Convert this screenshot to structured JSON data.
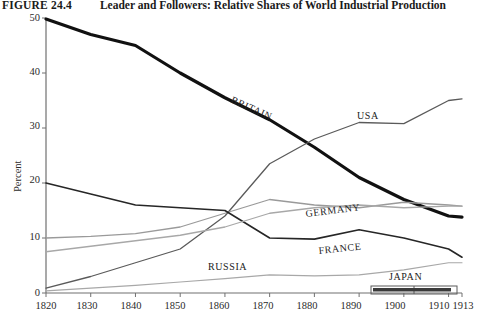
{
  "caption": {
    "figure_number": "FIGURE 24.4",
    "title": "Leader and Followers: Relative Shares of World Industrial Production"
  },
  "axis": {
    "ylabel": "Percent",
    "yticks": [
      "0",
      "10",
      "20",
      "30",
      "40",
      "50"
    ],
    "xticks": [
      "1820",
      "1830",
      "1840",
      "1850",
      "1860",
      "1870",
      "1880",
      "1890",
      "1900",
      "1910",
      "1913"
    ]
  },
  "series_labels": {
    "britain": "BRITAIN",
    "usa": "USA",
    "germany": "GERMANY",
    "france": "FRANCE",
    "russia": "RUSSIA",
    "japan": "JAPAN"
  },
  "colors": {
    "britain": "#111111",
    "usa": "#5a5a5a",
    "germany": "#9a9a9a",
    "france": "#262626",
    "russia": "#a8a8a8",
    "axis": "#707070",
    "text": "#222222"
  },
  "chart_data": {
    "type": "line",
    "title": "Leader and Followers: Relative Shares of World Industrial Production",
    "xlabel": "",
    "ylabel": "Percent",
    "xlim": [
      1820,
      1913
    ],
    "ylim": [
      0,
      50
    ],
    "grid": false,
    "legend": "inline-labels",
    "x": [
      1820,
      1830,
      1840,
      1850,
      1860,
      1870,
      1880,
      1890,
      1900,
      1910,
      1913
    ],
    "series": [
      {
        "name": "BRITAIN",
        "color": "#111111",
        "width": 3.2,
        "values": [
          49.8,
          47.0,
          45.0,
          40.0,
          35.5,
          31.5,
          26.5,
          21.0,
          17.0,
          14.0,
          13.8
        ]
      },
      {
        "name": "USA",
        "color": "#5a5a5a",
        "width": 1.3,
        "values": [
          0.9,
          3.0,
          5.5,
          8.0,
          14.0,
          23.5,
          28.0,
          31.0,
          30.8,
          35.0,
          35.3
        ]
      },
      {
        "name": "GERMANY",
        "color": "#9a9a9a",
        "width": 1.3,
        "values": [
          10.0,
          10.3,
          10.8,
          12.0,
          14.5,
          17.0,
          16.0,
          15.5,
          16.5,
          16.0,
          15.8
        ]
      },
      {
        "name": "FRANCE",
        "color": "#262626",
        "width": 1.6,
        "values": [
          20.0,
          18.0,
          16.0,
          15.5,
          15.0,
          10.0,
          9.8,
          11.5,
          10.0,
          8.0,
          6.5
        ]
      },
      {
        "name": "RUSSIA",
        "color": "#a8a8a8",
        "width": 1.3,
        "values": [
          7.5,
          8.5,
          9.5,
          10.5,
          12.0,
          14.5,
          15.5,
          16.0,
          15.5,
          15.8,
          15.8
        ]
      },
      {
        "name": "JAPAN-LOW",
        "color": "#a8a8a8",
        "width": 1.2,
        "values": [
          0.4,
          0.9,
          1.4,
          2.0,
          2.6,
          3.3,
          3.1,
          3.3,
          4.2,
          5.5,
          5.5
        ]
      }
    ],
    "annotations": [
      {
        "text": "JAPAN",
        "x": 1902,
        "y": 2.6,
        "kind": "bracket-label"
      }
    ]
  }
}
